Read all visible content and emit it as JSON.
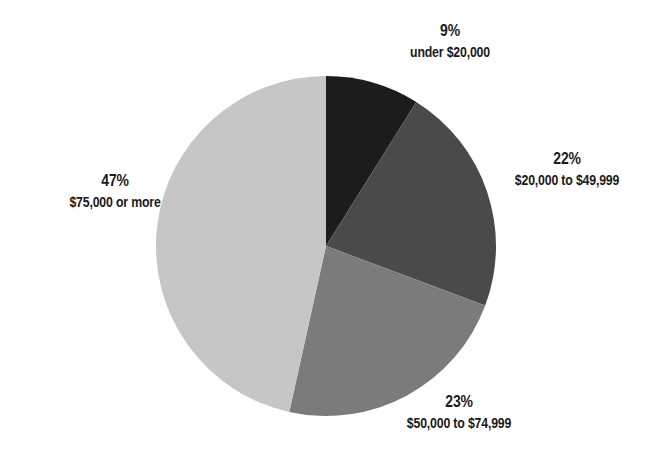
{
  "chart_data": {
    "type": "pie",
    "title": "",
    "categories": [
      "under $20,000",
      "$20,000 to $49,999",
      "$50,000 to $74,999",
      "$75,000 or more"
    ],
    "values": [
      9,
      22,
      23,
      47
    ],
    "unit": "%",
    "colors": [
      "#1c1c1c",
      "#4a4a4a",
      "#7b7b7b",
      "#c6c6c6"
    ],
    "start_angle_deg": 0,
    "direction": "clockwise",
    "legend": "none",
    "labels": [
      {
        "pct": "9%",
        "text": "under $20,000"
      },
      {
        "pct": "22%",
        "text": "$20,000 to $49,999"
      },
      {
        "pct": "23%",
        "text": "$50,000 to $74,999"
      },
      {
        "pct": "47%",
        "text": "$75,000 or more"
      }
    ]
  }
}
